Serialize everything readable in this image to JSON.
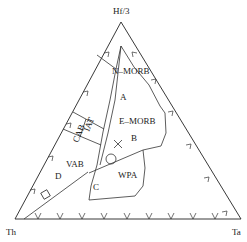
{
  "diagram": {
    "type": "ternary",
    "vertices": {
      "top": "Hf/3",
      "left": "Th",
      "right": "Ta"
    },
    "fields": {
      "n_morb": "N–MORB",
      "a": "A",
      "e_morb": "E–MORB",
      "b": "B",
      "wpa": "WPA",
      "c": "C",
      "d": "D",
      "vab": "VAB",
      "cab": "CAB",
      "iat": "IAT"
    },
    "symbols": [
      {
        "name": "cross",
        "glyph": "×"
      },
      {
        "name": "circle",
        "glyph": "○"
      },
      {
        "name": "square",
        "glyph": "◇"
      }
    ],
    "colors": {
      "line": "#333333",
      "background": "#ffffff"
    }
  }
}
